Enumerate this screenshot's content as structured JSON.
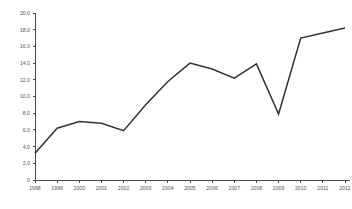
{
  "chart_data": {
    "type": "line",
    "title": "",
    "subtitle": "",
    "xlabel": "",
    "ylabel": "",
    "categories": [
      "1998",
      "1999",
      "2000",
      "2001",
      "2002",
      "2003",
      "2004",
      "2005",
      "2006",
      "2007",
      "2008",
      "2009",
      "2010",
      "2011",
      "2012"
    ],
    "values": [
      3.2,
      6.2,
      7.0,
      6.8,
      5.9,
      9.0,
      11.8,
      14.0,
      13.3,
      12.2,
      13.9,
      7.9,
      17.0,
      17.6,
      18.2
    ],
    "series": [
      {
        "name": "",
        "values": [
          3.2,
          6.2,
          7.0,
          6.8,
          5.9,
          9.0,
          11.8,
          14.0,
          13.3,
          12.2,
          13.9,
          7.9,
          17.0,
          17.6,
          18.2
        ]
      }
    ],
    "ylim": [
      0,
      20
    ],
    "xlim": [
      "1998",
      "2012"
    ],
    "y_ticks": [
      0,
      2,
      4,
      6,
      8,
      10,
      12,
      14,
      16,
      18,
      20
    ],
    "y_tick_labels": [
      "0",
      "2.0",
      "4.0",
      "6.0",
      "8.0",
      "10.0",
      "12.0",
      "14.0",
      "16.0",
      "18.0",
      "20.0"
    ],
    "x_tick_labels": [
      "1998",
      "1999",
      "2000",
      "2001",
      "2002",
      "2003",
      "2004",
      "2005",
      "2006",
      "2007",
      "2008",
      "2009",
      "2010",
      "2011",
      "2012"
    ],
    "grid": false,
    "legend": null,
    "legend_position": "none",
    "annotations": [],
    "line_color": "#333333",
    "axis_color": "#4a4a4a",
    "label_color": "#555555",
    "background_color": "#ffffff"
  },
  "layout": {
    "plot_left": 35,
    "plot_right": 345,
    "plot_top": 13,
    "plot_bottom": 180
  }
}
